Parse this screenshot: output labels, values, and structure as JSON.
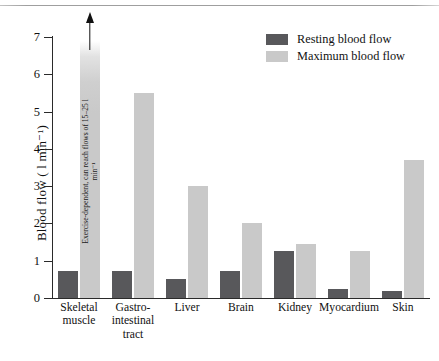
{
  "chart_data": {
    "type": "bar",
    "title": "",
    "xlabel": "",
    "ylabel": "Blood flow ( l min⁻¹)",
    "ylim": [
      0,
      7
    ],
    "yticks": [
      0,
      1,
      2,
      3,
      4,
      5,
      6,
      7
    ],
    "grid": false,
    "legend_position": "top-right",
    "categories": [
      "Skeletal muscle",
      "Gastro-intestinal tract",
      "Liver",
      "Brain",
      "Kidney",
      "Myocardium",
      "Skin"
    ],
    "category_labels": [
      [
        "Skeletal",
        "muscle"
      ],
      [
        "Gastro-",
        "intestinal",
        "tract"
      ],
      [
        "Liver"
      ],
      [
        "Brain"
      ],
      [
        "Kidney"
      ],
      [
        "Myocardium"
      ],
      [
        "Skin"
      ]
    ],
    "series": [
      {
        "name": "Resting blood flow",
        "color": "#58585b",
        "values": [
          0.72,
          0.72,
          0.5,
          0.72,
          1.25,
          0.25,
          0.2
        ]
      },
      {
        "name": "Maximum blood flow",
        "color": "#c9c9c9",
        "values": [
          6.9,
          5.5,
          3.0,
          2.0,
          1.45,
          1.25,
          3.7
        ]
      }
    ],
    "annotations": [
      {
        "target": "Skeletal muscle",
        "series": "Maximum blood flow",
        "text": "Exercise-dependent, can reach flows of 15–25 l min⁻¹",
        "arrow": "up",
        "note": "bar truncated / axis-break indicated by upward arrow"
      }
    ]
  },
  "legend": {
    "items": [
      {
        "label": "Resting blood flow",
        "color": "#58585b",
        "swatch": "resting-swatch"
      },
      {
        "label": "Maximum blood flow",
        "color": "#c9c9c9",
        "swatch": "maximum-swatch"
      }
    ]
  },
  "axes": {
    "y_title": "Blood flow ( l min⁻¹)",
    "y_tick_labels": [
      "0",
      "1",
      "2",
      "3",
      "4",
      "5",
      "6",
      "7"
    ]
  }
}
